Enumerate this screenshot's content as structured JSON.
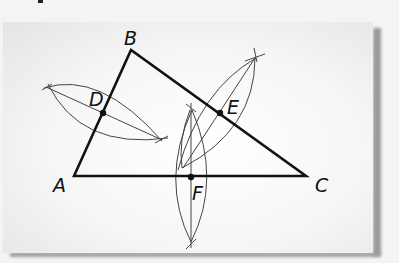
{
  "figure": {
    "vertices": [
      {
        "label": "A",
        "x": 74,
        "y": 176
      },
      {
        "label": "B",
        "x": 131,
        "y": 50
      },
      {
        "label": "C",
        "x": 306,
        "y": 176
      }
    ],
    "midpoints": [
      {
        "label": "D",
        "x": 103,
        "y": 113
      },
      {
        "label": "E",
        "x": 220,
        "y": 113
      },
      {
        "label": "F",
        "x": 191,
        "y": 177
      }
    ],
    "labels": {
      "A": "A",
      "B": "B",
      "C": "C",
      "D": "D",
      "E": "E",
      "F": "F"
    },
    "colors": {
      "triangle": "#111111",
      "construction": "#444444",
      "panel": "#f7f7f7"
    }
  }
}
